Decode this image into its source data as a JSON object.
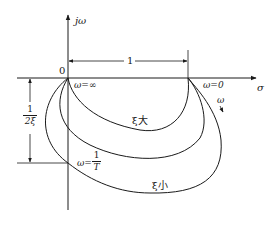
{
  "diagram": {
    "type": "polar/nyquist-style frequency response loci in the s-plane",
    "axes": {
      "vertical_label": "jω",
      "horizontal_label": "σ",
      "origin_label": "0"
    },
    "dimensions": {
      "horizontal_span_label": "1",
      "vertical_span_label": {
        "numerator": "1",
        "denominator": "2ξ"
      }
    },
    "point_labels": {
      "omega_infinity": "ω=∞",
      "omega_zero": "ω=0",
      "omega_one_over_T": {
        "prefix": "ω=",
        "numerator": "1",
        "denominator": "T"
      },
      "omega_direction": "ω"
    },
    "curves": [
      {
        "id": "xi-large",
        "label": "ξ大"
      },
      {
        "id": "xi-medium",
        "label": ""
      },
      {
        "id": "xi-small",
        "label": "ξ小"
      }
    ],
    "colors": {
      "ink": "#1a1a1a",
      "background": "#ffffff"
    }
  }
}
